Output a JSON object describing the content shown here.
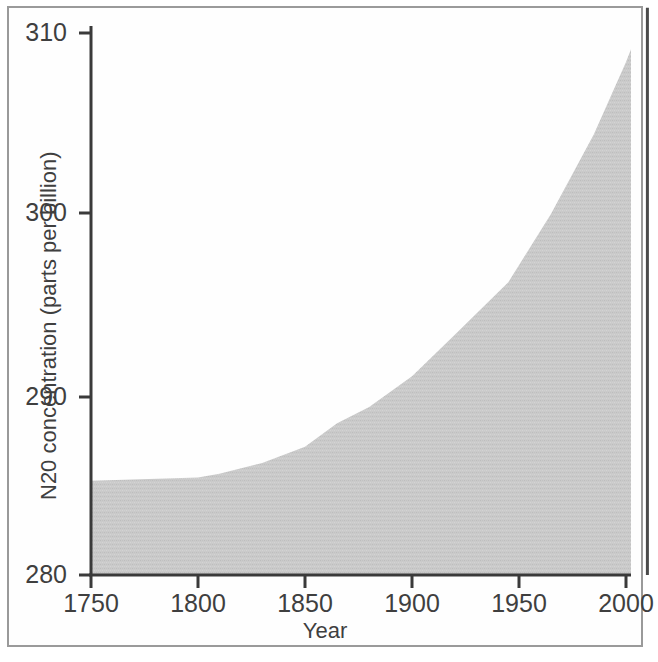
{
  "chart_data": {
    "type": "area",
    "title": "",
    "xlabel": "Year",
    "ylabel": "N20 concentration (parts per billion)",
    "xlim": [
      1740,
      2012
    ],
    "ylim": [
      280,
      311.5
    ],
    "xticks": [
      1750,
      1800,
      1850,
      1900,
      1950,
      2000
    ],
    "xtick_labels": [
      "1750",
      "1800",
      "1850",
      "1900",
      "1950",
      "2000"
    ],
    "yticks": [
      280,
      290,
      300,
      310
    ],
    "ytick_labels": [
      "280",
      "290",
      "300",
      "310"
    ],
    "grid": false,
    "legend": null,
    "fill_color": "#c9c9c9",
    "axis_color": "#3a3a3a",
    "series": [
      {
        "name": "N2O concentration",
        "x": [
          1745,
          1800,
          1810,
          1830,
          1850,
          1865,
          1880,
          1900,
          1920,
          1945,
          1965,
          1985,
          2000,
          2010
        ],
        "values": [
          285.2,
          285.4,
          285.6,
          286.2,
          287.1,
          288.4,
          289.3,
          291.0,
          293.3,
          296.2,
          300.0,
          304.4,
          308.4,
          311.4
        ]
      }
    ],
    "annotations": []
  },
  "axis": {
    "y_title": "N20 concentration (parts per billion)",
    "x_title": "Year"
  }
}
